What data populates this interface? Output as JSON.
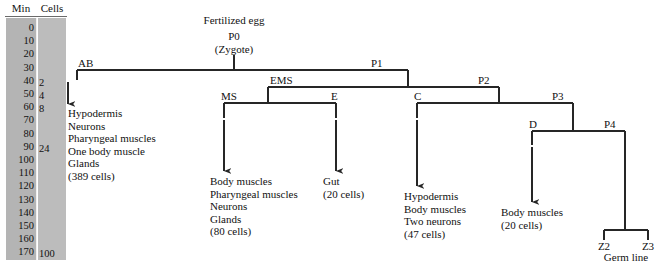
{
  "panel": {
    "header_min": "Min",
    "header_cells": "Cells",
    "minutes": [
      "0",
      "10",
      "20",
      "30",
      "40",
      "50",
      "60",
      "70",
      "80",
      "90",
      "100",
      "110",
      "120",
      "130",
      "140",
      "150",
      "160",
      "170"
    ],
    "cells": [
      {
        "label": "2",
        "minute": "40"
      },
      {
        "label": "4",
        "minute": "50"
      },
      {
        "label": "8",
        "minute": "60"
      },
      {
        "label": "24",
        "minute": "90"
      },
      {
        "label": "100",
        "minute": "170"
      }
    ]
  },
  "root": {
    "title": "Fertilized egg",
    "name": "P0",
    "subtitle": "(Zygote)"
  },
  "nodes": {
    "ab": "AB",
    "p1": "P1",
    "ems": "EMS",
    "p2": "P2",
    "ms": "MS",
    "e": "E",
    "c": "C",
    "p3": "P3",
    "d": "D",
    "p4": "P4",
    "z2": "Z2",
    "z3": "Z3",
    "germline": "Germ line"
  },
  "fates": {
    "ab": {
      "lines": [
        "Hypodermis",
        "Neurons",
        "Pharyngeal muscles",
        "One body muscle",
        "Glands"
      ],
      "count": "(389 cells)"
    },
    "ms": {
      "lines": [
        "Body muscles",
        "Pharyngeal muscles",
        "Neurons",
        "Glands"
      ],
      "count": "(80 cells)"
    },
    "e": {
      "lines": [
        "Gut"
      ],
      "count": "(20 cells)"
    },
    "c": {
      "lines": [
        "Hypodermis",
        "Body muscles",
        "Two neurons"
      ],
      "count": "(47 cells)"
    },
    "d": {
      "lines": [
        "Body muscles"
      ],
      "count": "(20 cells)"
    }
  },
  "colors": {
    "line": "#262626",
    "panel_minutes_bg": "#b4b4b4",
    "panel_cells_bg": "#bcbcbc",
    "text": "#111111"
  }
}
